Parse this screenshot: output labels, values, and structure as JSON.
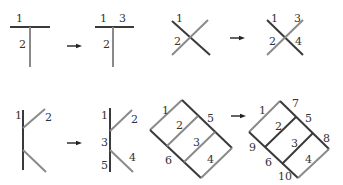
{
  "diagram": {
    "type": "line-segment-splitting",
    "colors": {
      "dark_line": "#3a3a3a",
      "gray_line": "#8a8a8a",
      "text": "#333333"
    },
    "panels": [
      {
        "id": "t-junction",
        "before": {
          "labels": [
            "1",
            "2"
          ]
        },
        "after": {
          "labels": [
            "1",
            "3",
            "2"
          ]
        }
      },
      {
        "id": "x-crossing",
        "before": {
          "labels": [
            "1",
            "2"
          ]
        },
        "after": {
          "labels": [
            "1",
            "3",
            "2",
            "4"
          ]
        }
      },
      {
        "id": "k-junction",
        "before": {
          "labels": [
            "1",
            "2"
          ]
        },
        "after": {
          "labels": [
            "1",
            "2",
            "3",
            "4",
            "5"
          ]
        }
      },
      {
        "id": "parallelogram",
        "before": {
          "labels": [
            "1",
            "2",
            "5",
            "3",
            "6",
            "4"
          ]
        },
        "after": {
          "labels": [
            "1",
            "7",
            "5",
            "2",
            "8",
            "9",
            "3",
            "6",
            "4",
            "10"
          ]
        }
      }
    ]
  }
}
